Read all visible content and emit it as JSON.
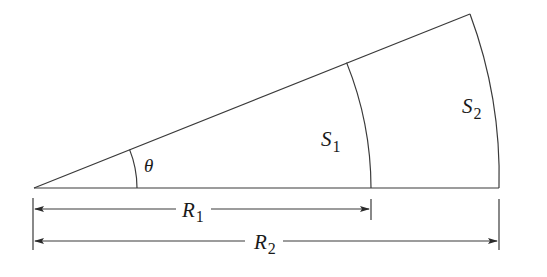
{
  "diagram": {
    "type": "circular-sector-arc-lengths",
    "labels": {
      "angle": "θ",
      "arc_inner": {
        "main": "S",
        "sub": "1"
      },
      "arc_outer": {
        "main": "S",
        "sub": "2"
      },
      "radius_inner": {
        "main": "R",
        "sub": "1"
      },
      "radius_outer": {
        "main": "R",
        "sub": "2"
      }
    },
    "geometry": {
      "vertex": [
        34,
        188
      ],
      "angle_deg": 21.9,
      "R1_px": 337,
      "R2_px": 465,
      "theta_arc_px": 103
    },
    "colors": {
      "line": "#3a3a3a",
      "text": "#1a1a1a",
      "background": "#ffffff"
    }
  }
}
